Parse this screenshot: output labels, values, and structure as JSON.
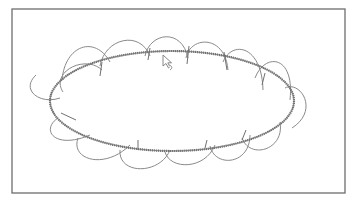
{
  "canvas": {
    "width": 358,
    "height": 205,
    "background": "#ffffff",
    "frame": {
      "x": 12,
      "y": 9,
      "width": 333,
      "height": 184,
      "color": "#6e6e6e"
    }
  },
  "drawing": {
    "ellipse": {
      "cx": 172,
      "cy": 101,
      "rx": 122,
      "ry": 50,
      "stroke": "#6a6a6a",
      "style": "textured"
    },
    "petal_color": "#8a8a8a",
    "petals": [
      {
        "d": "M 63 92 C 50 72, 85 54, 102 70"
      },
      {
        "d": "M 62 80 C 65 45, 95 35, 110 62"
      },
      {
        "d": "M 100 66 C 105 38, 140 30, 150 56"
      },
      {
        "d": "M 145 56 C 150 32, 182 28, 188 58"
      },
      {
        "d": "M 186 58 C 190 36, 225 34, 228 70"
      },
      {
        "d": "M 223 62 C 232 40, 262 45, 263 90"
      },
      {
        "d": "M 255 78 C 265 52, 295 55, 290 100"
      },
      {
        "d": "M 285 88 C 300 80, 320 110, 292 128"
      },
      {
        "d": "M 36 75 C 20 90, 40 105, 60 98"
      },
      {
        "d": "M 58 118 C 40 130, 55 150, 90 135"
      },
      {
        "d": "M 78 138 C 70 160, 105 170, 130 145"
      },
      {
        "d": "M 120 150 C 118 175, 160 175, 170 150"
      },
      {
        "d": "M 165 152 C 170 170, 205 170, 215 145"
      },
      {
        "d": "M 210 146 C 215 168, 250 165, 250 135"
      },
      {
        "d": "M 242 138 C 250 160, 285 150, 280 122"
      }
    ],
    "ticks": [
      {
        "x1": 61,
        "y1": 113,
        "x2": 76,
        "y2": 120
      },
      {
        "x1": 100,
        "y1": 76,
        "x2": 102,
        "y2": 62
      },
      {
        "x1": 148,
        "y1": 60,
        "x2": 150,
        "y2": 48
      },
      {
        "x1": 187,
        "y1": 64,
        "x2": 189,
        "y2": 46
      },
      {
        "x1": 227,
        "y1": 70,
        "x2": 224,
        "y2": 52
      },
      {
        "x1": 262,
        "y1": 85,
        "x2": 265,
        "y2": 73
      },
      {
        "x1": 138,
        "y1": 150,
        "x2": 138,
        "y2": 140
      },
      {
        "x1": 205,
        "y1": 148,
        "x2": 207,
        "y2": 140
      },
      {
        "x1": 242,
        "y1": 140,
        "x2": 246,
        "y2": 130
      }
    ],
    "cursor": {
      "x": 163,
      "y": 55,
      "icon": "arrow-cursor-icon"
    }
  }
}
